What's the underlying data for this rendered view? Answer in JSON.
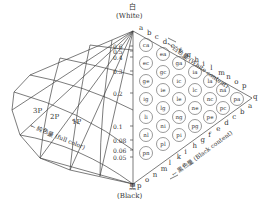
{
  "title_white": "白",
  "title_white_en": "(White)",
  "title_black": "黒",
  "title_black_en": "(Black)",
  "white_axis_label": "← 白色量 (White content)",
  "black_axis_label": "← 黒色量 (Black content)",
  "full_color_label": "← 純色量 (full color)",
  "white_letters": [
    "a",
    "b",
    "c",
    "d",
    "e",
    "f",
    "g",
    "h",
    "i",
    "l",
    "m",
    "n",
    "o",
    "p"
  ],
  "black_letters": [
    "p",
    "o",
    "n",
    "m",
    "l",
    "k",
    "i",
    "h",
    "g",
    "f",
    "e",
    "d",
    "c",
    "b",
    "a"
  ],
  "apex_right": "q",
  "scale_values": [
    "0.6",
    "0.5",
    "0.4",
    "0.3",
    "0.2",
    "0.1",
    "0.08",
    "0.06",
    "0.05"
  ],
  "solid_labels": [
    "3P",
    "2P",
    "1P"
  ],
  "columns": [
    [
      "ca",
      "ec",
      "ge",
      "ig",
      "li",
      "nl",
      "pn"
    ],
    [
      "ea",
      "gc",
      "ie",
      "lg",
      "ni",
      "pl"
    ],
    [
      "ga",
      "ic",
      "le",
      "ng",
      "pi"
    ],
    [
      "ia",
      "lc",
      "ne",
      "pg"
    ],
    [
      "la",
      "nc",
      "pe"
    ],
    [
      "na",
      "pc"
    ],
    [
      "pa"
    ]
  ]
}
